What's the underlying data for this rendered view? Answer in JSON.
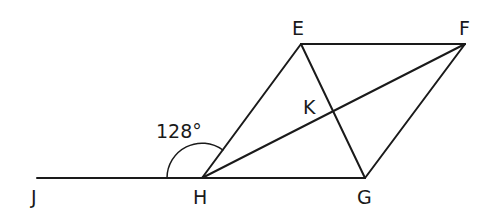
{
  "diagram": {
    "type": "geometry",
    "points": {
      "J": {
        "label": "J",
        "x": 37,
        "y": 178
      },
      "H": {
        "label": "H",
        "x": 202,
        "y": 178
      },
      "G": {
        "label": "G",
        "x": 365,
        "y": 178
      },
      "E": {
        "label": "E",
        "x": 301,
        "y": 44
      },
      "F": {
        "label": "F",
        "x": 465,
        "y": 44
      },
      "K": {
        "label": "K",
        "x": 333,
        "y": 112
      }
    },
    "segments": [
      "JG",
      "HE",
      "EF",
      "FG",
      "EG",
      "HF"
    ],
    "angle": {
      "vertex": "H",
      "between": [
        "J",
        "E"
      ],
      "label": "128°"
    },
    "labels": {
      "J": "J",
      "H": "H",
      "G": "G",
      "E": "E",
      "F": "F",
      "K": "K",
      "angle": "128°"
    }
  }
}
